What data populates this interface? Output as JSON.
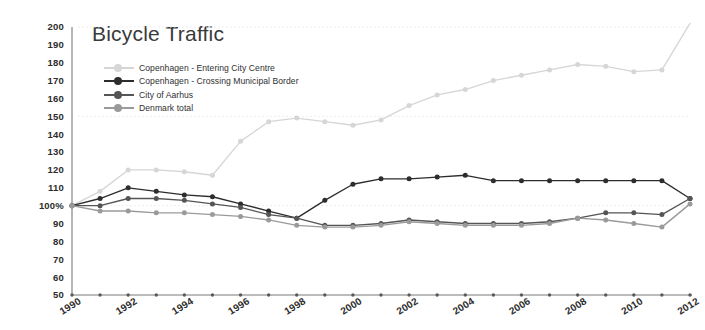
{
  "chart_data": {
    "type": "line",
    "title": "Bicycle Traffic",
    "xlabel": "",
    "ylabel": "",
    "ylim": [
      50,
      200
    ],
    "ytick_values": [
      50,
      60,
      70,
      80,
      90,
      100,
      110,
      120,
      130,
      140,
      150,
      160,
      170,
      180,
      190,
      200
    ],
    "ytick_labels": [
      "50",
      "60",
      "70",
      "80",
      "90",
      "100%",
      "110",
      "120",
      "130",
      "140",
      "150",
      "160",
      "170",
      "180",
      "190",
      "200"
    ],
    "grid": "horizontal dotted at 100, 150, 200",
    "legend_position": "top-left inside plot",
    "x": [
      1990,
      1991,
      1992,
      1993,
      1994,
      1995,
      1996,
      1997,
      1998,
      1999,
      2000,
      2001,
      2002,
      2003,
      2004,
      2005,
      2006,
      2007,
      2008,
      2009,
      2010,
      2011,
      2012
    ],
    "xtick_labels": [
      "1990",
      "1992",
      "1994",
      "1996",
      "1998",
      "2000",
      "2002",
      "2004",
      "2006",
      "2008",
      "2010",
      "2012"
    ],
    "series": [
      {
        "name": "Copenhagen - Entering City Centre",
        "color": "#d6d6d6",
        "values": [
          100,
          108,
          120,
          120,
          119,
          117,
          136,
          147,
          149,
          147,
          145,
          148,
          156,
          162,
          165,
          170,
          173,
          176,
          179,
          178,
          175,
          176,
          178
        ]
      },
      {
        "name": "Copenhagen - Crossing Municipal Border",
        "color": "#2d2d2d",
        "values": [
          100,
          104,
          110,
          108,
          106,
          105,
          101,
          97,
          93,
          103,
          112,
          115,
          115,
          116,
          117,
          114,
          114,
          114,
          114,
          114,
          114,
          114,
          115
        ]
      },
      {
        "name": "City of Aarhus",
        "color": "#555555",
        "values": [
          100,
          100,
          104,
          104,
          103,
          101,
          99,
          95,
          93,
          89,
          89,
          90,
          92,
          91,
          90,
          90,
          90,
          91,
          93,
          96,
          96,
          95,
          95
        ]
      },
      {
        "name": "Denmark total",
        "color": "#9a9a9a",
        "values": [
          100,
          97,
          97,
          96,
          96,
          95,
          94,
          92,
          89,
          88,
          88,
          89,
          91,
          90,
          89,
          89,
          89,
          90,
          93,
          92,
          90,
          88,
          86
        ]
      }
    ],
    "series_tail": {
      "note": "values continuing to 2012 endpoints",
      "copenhagen_centre_2012": 202,
      "copenhagen_border_2012": 104,
      "aarhus_2012": 104,
      "denmark_2012": 101
    }
  },
  "legend": {
    "items": [
      {
        "label": "Copenhagen - Entering City Centre",
        "color": "#d6d6d6"
      },
      {
        "label": "Copenhagen - Crossing Municipal Border",
        "color": "#2d2d2d"
      },
      {
        "label": "City of Aarhus",
        "color": "#555555"
      },
      {
        "label": "Denmark total",
        "color": "#9a9a9a"
      }
    ]
  }
}
